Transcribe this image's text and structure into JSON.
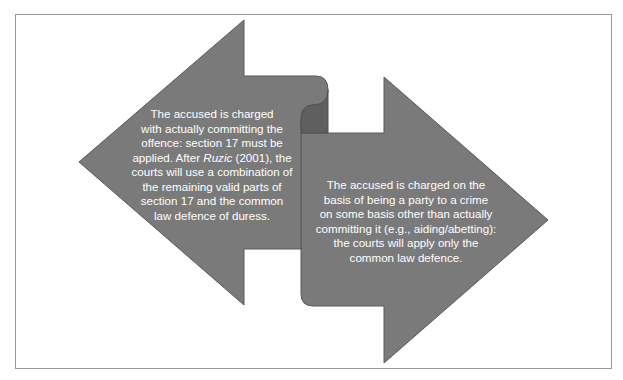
{
  "diagram": {
    "colors": {
      "arrow_fill": "#7a7a7a",
      "arrow_stroke": "#5a5a5a",
      "fold_shadow": "#5f5f5f",
      "text": "#ffffff",
      "frame_border": "#9a9a9a"
    },
    "left_arrow": {
      "direction": "left",
      "text_before_case": "The accused is charged\nwith actually committing the\noffence: section 17 must be\napplied. After ",
      "case_name": "Ruzic",
      "text_after_case": " (2001), the\ncourts will use a combination of\nthe remaining valid parts of\nsection 17 and the common\nlaw defence of duress."
    },
    "right_arrow": {
      "direction": "right",
      "text": "The accused is charged on the\nbasis of being a party to a crime\non some basis other than actually\ncommitting it (e.g., aiding/abetting):\nthe courts will apply only the\ncommon law defence."
    }
  }
}
